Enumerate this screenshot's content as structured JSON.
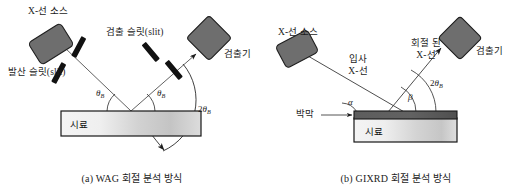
{
  "figure": {
    "background": "#ffffff",
    "ink": "#1c1c1c",
    "source_fill": "#6b6b6b",
    "slit_fill": "#111111",
    "sample_fill_light": "#f1f1f1",
    "sample_fill_mid": "#c9c9c9",
    "film_fill": "#595959",
    "panels": [
      {
        "id": "a",
        "caption": "(a) WAG 회절 분석 방식",
        "labels": {
          "source": "X-선 소스",
          "divergence_slit": "발산 슬릿(slit)",
          "detector_slit": "검출 슬릿(slit)",
          "detector": "검출기",
          "sample": "시료",
          "theta_left": "θ",
          "theta_left_sub": "B",
          "theta_right": "θ",
          "theta_right_sub": "B",
          "two_theta_num": "2",
          "two_theta": "θ",
          "two_theta_sub": "B"
        }
      },
      {
        "id": "b",
        "caption": "(b) GIXRD 회절 분석 방식",
        "labels": {
          "source": "X-선 소스",
          "incident_line1": "입사",
          "incident_line2": "X-선",
          "diffracted_line1": "회절 된",
          "diffracted_line2": "X-선",
          "detector": "검출기",
          "thin_film": "박막",
          "sample": "시료",
          "alpha": "α",
          "beta": "β",
          "two_theta_num": "2",
          "two_theta": "θ",
          "two_theta_sub": "B"
        }
      }
    ]
  }
}
